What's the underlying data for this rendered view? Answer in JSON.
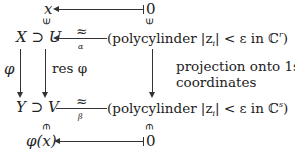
{
  "top_row": {
    "left": "x",
    "right": "0"
  },
  "middle_row": {
    "left": "X ⊃ U",
    "arrow_top_label": "≈",
    "arrow_bottom_label": "α",
    "right": "(polycylinder |z",
    "right_sub": "i",
    "right_tail": "| < ε in ℂ",
    "right_sup": "r",
    "right_close": ")"
  },
  "vertical_labels": {
    "left": "φ",
    "inner": "res φ",
    "right_line1": "projection onto 1st s",
    "right_line2": "coordinates"
  },
  "lower_row": {
    "left": "Y ⊃ V",
    "arrow_top_label": "≈",
    "arrow_bottom_label": "β",
    "right": "(polycylinder |z",
    "right_sub": "i",
    "right_tail": "| < ε in ℂ",
    "right_sup": "s",
    "right_close": ")"
  },
  "bottom_row": {
    "left": "φ(x)",
    "right": "0"
  },
  "membership_symbol": "∈"
}
